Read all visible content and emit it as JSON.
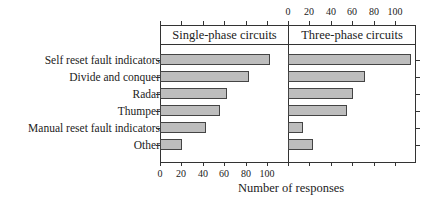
{
  "chart_data": {
    "type": "bar",
    "orientation": "horizontal",
    "title": "",
    "xlabel": "Number of responses",
    "ylabel": "",
    "xlim": [
      0,
      120
    ],
    "x_ticks": [
      0,
      20,
      40,
      60,
      80,
      100
    ],
    "categories": [
      "Self reset fault indicators",
      "Divide and conquer",
      "Radar",
      "Thumper",
      "Manual reset fault indicators",
      "Other"
    ],
    "series": [
      {
        "name": "Single-phase circuits",
        "values": [
          103,
          83,
          63,
          56,
          43,
          21
        ]
      },
      {
        "name": "Three-phase circuits",
        "values": [
          115,
          72,
          61,
          55,
          14,
          23
        ]
      }
    ],
    "panels": [
      "Single-phase circuits",
      "Three-phase circuits"
    ],
    "grid": false,
    "legend": "panel headers"
  },
  "labels": {
    "panel_left": "Single-phase circuits",
    "panel_right": "Three-phase circuits",
    "x_axis_title": "Number of responses",
    "tick_labels": [
      "0",
      "20",
      "40",
      "60",
      "80",
      "100"
    ]
  },
  "colors": {
    "bar_fill": "#bdbdbd",
    "bar_border": "#444444",
    "frame": "#333333"
  }
}
